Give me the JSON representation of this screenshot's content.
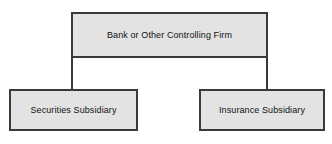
{
  "diagram": {
    "type": "organizational-hierarchy",
    "orientation": "top-down",
    "nodes": [
      {
        "id": "parent",
        "label": "Bank or Other Controlling Firm",
        "role": "parent",
        "fill": "#e3e3e3",
        "border": "#3a3a3a"
      },
      {
        "id": "securities",
        "label": "Securities Subsidiary",
        "role": "child",
        "fill": "#e3e3e3",
        "border": "#3a3a3a"
      },
      {
        "id": "insurance",
        "label": "Insurance Subsidiary",
        "role": "child",
        "fill": "#e3e3e3",
        "border": "#3a3a3a"
      }
    ],
    "edges": [
      {
        "id": "edge-left",
        "from": "parent",
        "to": "securities",
        "style": "solid"
      },
      {
        "id": "edge-right",
        "from": "parent",
        "to": "insurance",
        "style": "solid"
      }
    ],
    "colors": {
      "background": "#ffffff",
      "node_fill": "#e3e3e3",
      "node_border": "#3a3a3a",
      "text": "#111111",
      "connector": "#3a3a3a"
    }
  }
}
